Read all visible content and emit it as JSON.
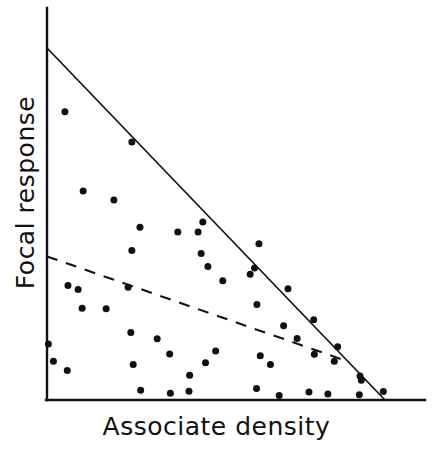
{
  "chart_data": {
    "type": "scatter",
    "title": "",
    "xlabel": "Associate density",
    "ylabel": "Focal response",
    "xlim": [
      0,
      100
    ],
    "ylim": [
      0,
      100
    ],
    "grid": false,
    "legend": null,
    "xticks": [],
    "yticks": [],
    "axis_style": "two-spine-open",
    "point_marker": "filled-circle",
    "point_color": "#101010",
    "point_size_px": 7,
    "line_color": "#101010",
    "points": [
      {
        "x": 5.3,
        "y": 81.9
      },
      {
        "x": 25.1,
        "y": 73.3
      },
      {
        "x": 10.7,
        "y": 59.4
      },
      {
        "x": 19.8,
        "y": 56.8
      },
      {
        "x": 27.5,
        "y": 49.1
      },
      {
        "x": 46.1,
        "y": 50.6
      },
      {
        "x": 38.7,
        "y": 47.7
      },
      {
        "x": 44.7,
        "y": 47.7
      },
      {
        "x": 25.1,
        "y": 42.5
      },
      {
        "x": 45.6,
        "y": 41.6
      },
      {
        "x": 47.6,
        "y": 37.9
      },
      {
        "x": 52.0,
        "y": 33.9
      },
      {
        "x": 62.7,
        "y": 44.4
      },
      {
        "x": 61.4,
        "y": 37.5
      },
      {
        "x": 60.1,
        "y": 35.7
      },
      {
        "x": 6.2,
        "y": 32.5
      },
      {
        "x": 9.2,
        "y": 31.4
      },
      {
        "x": 24.0,
        "y": 32.0
      },
      {
        "x": 10.4,
        "y": 26.1
      },
      {
        "x": 17.5,
        "y": 25.9
      },
      {
        "x": 71.3,
        "y": 31.6
      },
      {
        "x": 62.1,
        "y": 27.1
      },
      {
        "x": 70.0,
        "y": 21.1
      },
      {
        "x": 78.9,
        "y": 22.8
      },
      {
        "x": 74.0,
        "y": 17.5
      },
      {
        "x": 79.1,
        "y": 13.0
      },
      {
        "x": 24.8,
        "y": 19.2
      },
      {
        "x": 0.4,
        "y": 15.9
      },
      {
        "x": 32.6,
        "y": 17.4
      },
      {
        "x": 49.9,
        "y": 13.9
      },
      {
        "x": 36.3,
        "y": 13.1
      },
      {
        "x": 1.9,
        "y": 11.0
      },
      {
        "x": 6.0,
        "y": 8.4
      },
      {
        "x": 25.5,
        "y": 10.1
      },
      {
        "x": 46.9,
        "y": 10.6
      },
      {
        "x": 42.2,
        "y": 7.0
      },
      {
        "x": 63.1,
        "y": 12.6
      },
      {
        "x": 66.1,
        "y": 10.1
      },
      {
        "x": 86.0,
        "y": 15.1
      },
      {
        "x": 85.0,
        "y": 11.0
      },
      {
        "x": 92.6,
        "y": 6.8
      },
      {
        "x": 93.0,
        "y": 5.6
      },
      {
        "x": 27.7,
        "y": 2.8
      },
      {
        "x": 42.0,
        "y": 2.5
      },
      {
        "x": 36.5,
        "y": 1.9
      },
      {
        "x": 62.0,
        "y": 3.3
      },
      {
        "x": 68.7,
        "y": 1.3
      },
      {
        "x": 77.5,
        "y": 2.3
      },
      {
        "x": 83.1,
        "y": 1.7
      },
      {
        "x": 92.4,
        "y": 1.5
      },
      {
        "x": 99.5,
        "y": 2.4
      }
    ],
    "bounding_line": {
      "style": "solid",
      "label": "upper envelope",
      "start": {
        "x": 0,
        "y": 100
      },
      "end": {
        "x": 100,
        "y": 0
      }
    },
    "trend_line": {
      "style": "dashed",
      "label": "regression",
      "start": {
        "x": 0,
        "y": 40.8
      },
      "end": {
        "x": 88.0,
        "y": 11.3
      }
    }
  }
}
